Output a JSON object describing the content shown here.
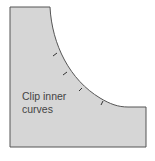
{
  "diagram": {
    "label_lines": [
      "Clip inner",
      "curves"
    ],
    "fill_color": "#d6d6d6",
    "stroke_color": "#555555",
    "tick_count": 4
  }
}
